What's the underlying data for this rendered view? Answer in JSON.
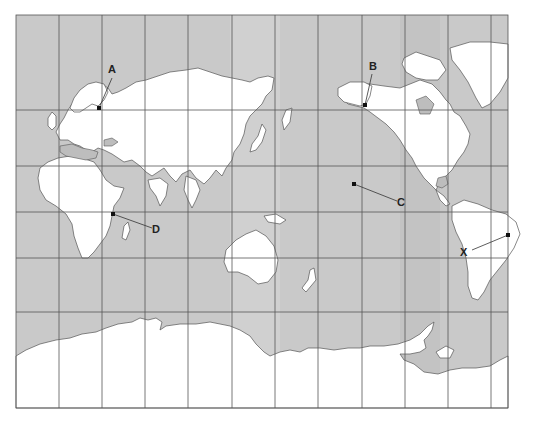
{
  "map": {
    "projection": "world map (Pacific-centered, cylindrical)",
    "frame": {
      "left": 16,
      "top": 15,
      "right": 508,
      "bottom": 408
    },
    "grid": {
      "vertical_x": [
        16,
        59,
        102,
        145,
        188,
        232,
        275,
        318,
        362,
        405,
        448,
        491,
        508
      ],
      "horizontal_y": [
        15,
        110,
        166,
        212,
        258,
        312,
        408
      ]
    },
    "colors": {
      "ocean": "#c9c9c9",
      "land": "#ffffff",
      "inland_sea": "#bdbdbd",
      "coast": "#555555",
      "grid": "#555555",
      "label": "#222222"
    }
  },
  "markers": [
    {
      "id": "A",
      "label": "A",
      "location": "Northern Europe (Baltic / near Stockholm)",
      "point": [
        99,
        108
      ],
      "label_pos": [
        111,
        69
      ]
    },
    {
      "id": "B",
      "label": "B",
      "location": "Alaska",
      "point": [
        365,
        105
      ],
      "label_pos": [
        372,
        66
      ]
    },
    {
      "id": "C",
      "label": "C",
      "location": "Central Pacific Ocean",
      "point": [
        354,
        184
      ],
      "label_pos": [
        400,
        202
      ]
    },
    {
      "id": "D",
      "label": "D",
      "location": "East Africa (Kenya / Lake Victoria)",
      "point": [
        113,
        214
      ],
      "label_pos": [
        155,
        229
      ]
    },
    {
      "id": "X",
      "label": "X",
      "location": "Brazil, South America",
      "point": [
        508,
        235
      ],
      "label_pos": [
        463,
        252
      ]
    }
  ]
}
